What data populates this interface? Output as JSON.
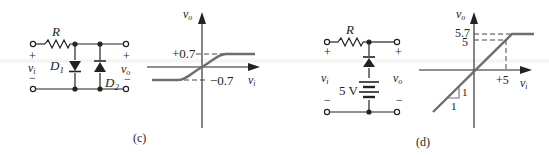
{
  "panel_c": {
    "caption": "(c)",
    "circuit": {
      "resistor_label": "R",
      "diode1_label": "D",
      "diode1_sub": "1",
      "diode2_label": "D",
      "diode2_sub": "2",
      "input_plus": "+",
      "input_minus": "−",
      "input_label": "v",
      "input_sub": "i",
      "output_plus": "+",
      "output_minus": "−",
      "output_label": "v",
      "output_sub": "o"
    },
    "plot": {
      "y_axis_label": "v",
      "y_axis_sub": "o",
      "x_axis_label": "v",
      "x_axis_sub": "i",
      "upper_level": "+0.7",
      "lower_level": "−0.7"
    }
  },
  "panel_d": {
    "caption": "(d)",
    "circuit": {
      "resistor_label": "R",
      "battery_label": "5 V",
      "input_plus": "+",
      "input_minus": "−",
      "input_label": "v",
      "input_sub": "i",
      "output_plus": "+",
      "output_minus": "−",
      "output_label": "v",
      "output_sub": "o"
    },
    "plot": {
      "y_axis_label": "v",
      "y_axis_sub": "o",
      "x_axis_label": "v",
      "x_axis_sub": "i",
      "clip_level": "5.7",
      "ref_level": "5",
      "x_tick": "+5",
      "slope_run": "1",
      "slope_rise": "1"
    }
  },
  "colors": {
    "ink": "#222222",
    "curve": "#6e6e6e",
    "dash": "#444444"
  }
}
